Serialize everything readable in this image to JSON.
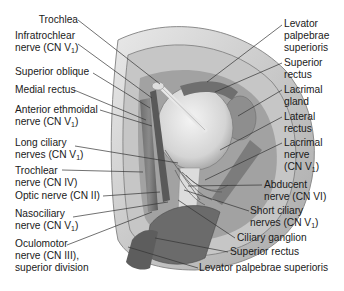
{
  "figure": {
    "colors": {
      "background": "#ffffff",
      "illustration_gray": "#9a9a9a",
      "leader_line": "#333333",
      "text": "#1a1a1a"
    }
  },
  "labels_left": [
    {
      "id": "trochlea",
      "lines": [
        "Trochlea"
      ]
    },
    {
      "id": "infratrochlear-nerve",
      "lines": [
        "Infratrochlear",
        "nerve (CN V1)"
      ]
    },
    {
      "id": "superior-oblique",
      "lines": [
        "Superior oblique"
      ]
    },
    {
      "id": "medial-rectus",
      "lines": [
        "Medial rectus"
      ]
    },
    {
      "id": "anterior-ethmoidal-nerve",
      "lines": [
        "Anterior ethmoidal",
        "nerve (CN V1)"
      ]
    },
    {
      "id": "long-ciliary-nerves",
      "lines": [
        "Long ciliary",
        "nerves (CN V1)"
      ]
    },
    {
      "id": "trochlear-nerve",
      "lines": [
        "Trochlear",
        "nerve (CN IV)"
      ]
    },
    {
      "id": "optic-nerve",
      "lines": [
        "Optic nerve (CN II)"
      ]
    },
    {
      "id": "nasociliary-nerve",
      "lines": [
        "Nasociliary",
        "nerve (CN V1)"
      ]
    },
    {
      "id": "oculomotor-nerve",
      "lines": [
        "Oculomotor",
        "nerve (CN III),",
        "superior division"
      ]
    }
  ],
  "labels_right": [
    {
      "id": "levator-palpebrae-superioris-top",
      "lines": [
        "Levator",
        "palpebrae",
        "superioris"
      ]
    },
    {
      "id": "superior-rectus-top",
      "lines": [
        "Superior",
        "rectus"
      ]
    },
    {
      "id": "lacrimal-gland",
      "lines": [
        "Lacrimal",
        "gland"
      ]
    },
    {
      "id": "lateral-rectus",
      "lines": [
        "Lateral",
        "rectus"
      ]
    },
    {
      "id": "lacrimal-nerve",
      "lines": [
        "Lacrimal",
        "nerve",
        "(CN V1)"
      ]
    },
    {
      "id": "abducent-nerve",
      "lines": [
        "Abducent",
        "nerve (CN VI)"
      ]
    },
    {
      "id": "short-ciliary-nerves",
      "lines": [
        "Short ciliary",
        "nerves (CN V1)"
      ]
    },
    {
      "id": "ciliary-ganglion",
      "lines": [
        "Ciliary ganglion"
      ]
    },
    {
      "id": "superior-rectus-bottom",
      "lines": [
        "Superior rectus"
      ]
    },
    {
      "id": "levator-palpebrae-superioris-bottom",
      "lines": [
        "Levator palpebrae superioris"
      ]
    }
  ],
  "text": {
    "trochlea": "Trochlea",
    "infratrochlear_1": "Infratrochlear",
    "infratrochlear_2": "nerve (CN V",
    "superior_oblique": "Superior oblique",
    "medial_rectus": "Medial rectus",
    "ant_ethmoidal_1": "Anterior ethmoidal",
    "ant_ethmoidal_2": "nerve (CN V",
    "long_ciliary_1": "Long ciliary",
    "long_ciliary_2": "nerves (CN V",
    "trochlear_1": "Trochlear",
    "trochlear_2": "nerve (CN IV)",
    "optic": "Optic nerve (CN II)",
    "nasociliary_1": "Nasociliary",
    "nasociliary_2": "nerve (CN V",
    "oculomotor_1": "Oculomotor",
    "oculomotor_2": "nerve (CN III),",
    "oculomotor_3": "superior division",
    "levator_1": "Levator",
    "levator_2": "palpebrae",
    "levator_3": "superioris",
    "sup_rectus_1": "Superior",
    "sup_rectus_2": "rectus",
    "lac_gland_1": "Lacrimal",
    "lac_gland_2": "gland",
    "lat_rectus_1": "Lateral",
    "lat_rectus_2": "rectus",
    "lac_nerve_1": "Lacrimal",
    "lac_nerve_2": "nerve",
    "lac_nerve_3": "(CN V",
    "abducent_1": "Abducent",
    "abducent_2": "nerve (CN VI)",
    "short_ciliary_1": "Short ciliary",
    "short_ciliary_2": "nerves (CN V",
    "ciliary_ganglion": "Ciliary ganglion",
    "sup_rectus_bottom": "Superior rectus",
    "levator_bottom": "Levator palpebrae superioris",
    "sub_1": "1",
    "close_paren": ")"
  }
}
